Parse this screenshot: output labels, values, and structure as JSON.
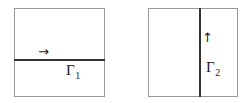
{
  "figure": {
    "background_color": "#ffffff",
    "width": 245,
    "height": 103,
    "border_color": "#9a9a9a",
    "interface_color": "#333333",
    "text_color": "#1a1a1a"
  },
  "panels": [
    {
      "id": "left",
      "name": "left-domain-square",
      "interface": {
        "orientation": "horizontal",
        "label_symbol": "Γ",
        "label_subscript": "1"
      },
      "arrow": {
        "glyph": "→",
        "direction": "right",
        "name": "normal-direction-arrow"
      }
    },
    {
      "id": "right",
      "name": "right-domain-square",
      "interface": {
        "orientation": "vertical",
        "label_symbol": "Γ",
        "label_subscript": "2"
      },
      "arrow": {
        "glyph": "↑",
        "direction": "up",
        "name": "normal-direction-arrow"
      }
    }
  ]
}
